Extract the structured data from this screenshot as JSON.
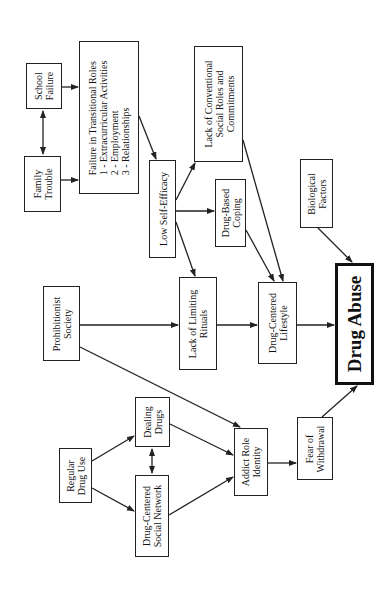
{
  "diagram": {
    "title": "Drug Abuse",
    "orientation": "rotated-90-ccw",
    "nodes": [
      {
        "id": "school_failure",
        "lines": [
          "School",
          "Failure"
        ],
        "x": 26,
        "y": 63,
        "w": 36,
        "h": 46
      },
      {
        "id": "family_trouble",
        "lines": [
          "Family",
          "Trouble"
        ],
        "x": 24,
        "y": 156,
        "w": 37,
        "h": 56
      },
      {
        "id": "failure_transitional",
        "lines": [
          "Failure in Transitional Roles",
          "1 - Extracurricular Activities",
          "2 - Employment",
          "3 - Relationships"
        ],
        "x": 79,
        "y": 41,
        "w": 60,
        "h": 153,
        "align": "left"
      },
      {
        "id": "low_self_efficacy",
        "lines": [
          "Low Self-Efficacy"
        ],
        "x": 149,
        "y": 160,
        "w": 27,
        "h": 98
      },
      {
        "id": "lack_conventional",
        "lines": [
          "Lack of Conventional",
          "Social Roles and",
          "Commitments"
        ],
        "x": 194,
        "y": 46,
        "w": 49,
        "h": 116
      },
      {
        "id": "drug_based_coping",
        "lines": [
          "Drug-Based",
          "Coping"
        ],
        "x": 215,
        "y": 179,
        "w": 31,
        "h": 68
      },
      {
        "id": "biological_factors",
        "lines": [
          "Biological",
          "Factors"
        ],
        "x": 300,
        "y": 159,
        "w": 33,
        "h": 69
      },
      {
        "id": "prohibitionist_society",
        "lines": [
          "Prohibitionist",
          "Society"
        ],
        "x": 43,
        "y": 286,
        "w": 37,
        "h": 75
      },
      {
        "id": "lack_limiting_rituals",
        "lines": [
          "Lack of Limiting",
          "Rituals"
        ],
        "x": 179,
        "y": 277,
        "w": 38,
        "h": 93
      },
      {
        "id": "drug_centered_lifestyle",
        "lines": [
          "Drug-Centered",
          "Lifestyle"
        ],
        "x": 258,
        "y": 282,
        "w": 39,
        "h": 82
      },
      {
        "id": "drug_abuse",
        "lines": [
          "Drug Abuse"
        ],
        "x": 335,
        "y": 263,
        "w": 39,
        "h": 122,
        "main": true
      },
      {
        "id": "dealing_drugs",
        "lines": [
          "Dealing",
          "Drugs"
        ],
        "x": 135,
        "y": 397,
        "w": 35,
        "h": 50
      },
      {
        "id": "regular_drug_use",
        "lines": [
          "Regular",
          "Drug Use"
        ],
        "x": 59,
        "y": 448,
        "w": 33,
        "h": 55
      },
      {
        "id": "drug_centered_social_network",
        "lines": [
          "Drug-Centered",
          "Social Network"
        ],
        "x": 135,
        "y": 475,
        "w": 34,
        "h": 82
      },
      {
        "id": "addict_role_identity",
        "lines": [
          "Addict Role",
          "Identity"
        ],
        "x": 234,
        "y": 428,
        "w": 34,
        "h": 68
      },
      {
        "id": "fear_of_withdrawal",
        "lines": [
          "Fear of",
          "Withdrawal"
        ],
        "x": 297,
        "y": 417,
        "w": 36,
        "h": 63
      }
    ],
    "edges": [
      {
        "from": "school_failure",
        "to": "family_trouble",
        "bidirectional": true,
        "pts": [
          43,
          111,
          43,
          154
        ]
      },
      {
        "from": "school_failure",
        "to": "failure_transitional",
        "pts": [
          62,
          87,
          78,
          87
        ]
      },
      {
        "from": "family_trouble",
        "to": "failure_transitional",
        "pts": [
          61,
          180,
          78,
          180
        ]
      },
      {
        "from": "failure_transitional",
        "to": "low_self_efficacy",
        "pts": [
          139,
          116,
          156,
          159
        ]
      },
      {
        "from": "low_self_efficacy",
        "to": "lack_conventional",
        "pts": [
          176,
          200,
          195,
          163
        ]
      },
      {
        "from": "low_self_efficacy",
        "to": "drug_based_coping",
        "pts": [
          176,
          211,
          214,
          211
        ]
      },
      {
        "from": "low_self_efficacy",
        "to": "lack_limiting_rituals",
        "pts": [
          176,
          222,
          195,
          276
        ]
      },
      {
        "from": "lack_conventional",
        "to": "drug_centered_lifestyle",
        "pts": [
          243,
          140,
          283,
          281
        ]
      },
      {
        "from": "drug_based_coping",
        "to": "drug_centered_lifestyle",
        "pts": [
          246,
          230,
          274,
          281
        ]
      },
      {
        "from": "biological_factors",
        "to": "drug_abuse",
        "pts": [
          318,
          228,
          352,
          262
        ]
      },
      {
        "from": "prohibitionist_society",
        "to": "lack_limiting_rituals",
        "pts": [
          80,
          325,
          178,
          325
        ]
      },
      {
        "from": "prohibitionist_society",
        "to": "addict_role_identity",
        "pts": [
          80,
          347,
          240,
          427
        ]
      },
      {
        "from": "lack_limiting_rituals",
        "to": "drug_centered_lifestyle",
        "pts": [
          217,
          325,
          257,
          325
        ]
      },
      {
        "from": "drug_centered_lifestyle",
        "to": "drug_abuse",
        "pts": [
          297,
          325,
          334,
          325
        ]
      },
      {
        "from": "regular_drug_use",
        "to": "dealing_drugs",
        "pts": [
          92,
          461,
          134,
          436
        ]
      },
      {
        "from": "regular_drug_use",
        "to": "drug_centered_social_network",
        "pts": [
          92,
          488,
          134,
          511
        ]
      },
      {
        "from": "dealing_drugs",
        "to": "drug_centered_social_network",
        "bidirectional": true,
        "pts": [
          152,
          449,
          152,
          473
        ]
      },
      {
        "from": "dealing_drugs",
        "to": "addict_role_identity",
        "pts": [
          170,
          424,
          233,
          455
        ]
      },
      {
        "from": "drug_centered_social_network",
        "to": "addict_role_identity",
        "pts": [
          169,
          515,
          233,
          477
        ]
      },
      {
        "from": "addict_role_identity",
        "to": "fear_of_withdrawal",
        "pts": [
          268,
          463,
          296,
          463
        ]
      },
      {
        "from": "fear_of_withdrawal",
        "to": "drug_abuse",
        "pts": [
          322,
          417,
          357,
          386
        ]
      }
    ],
    "colors": {
      "stroke": "#222222",
      "background": "#ffffff"
    }
  }
}
